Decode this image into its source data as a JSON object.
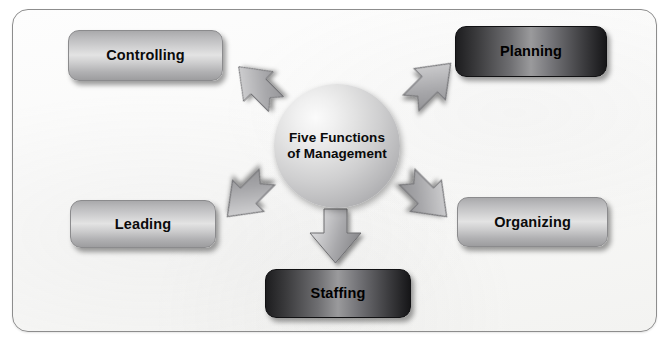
{
  "diagram": {
    "title": "Five Functions of Management",
    "center": {
      "label_line1": "Five Functions",
      "label_line2": "of Management",
      "shape": "sphere"
    },
    "boxes": [
      {
        "id": "controlling",
        "label": "Controlling",
        "style": "light",
        "position": "top-left"
      },
      {
        "id": "planning",
        "label": "Planning",
        "style": "dark",
        "position": "top-right"
      },
      {
        "id": "leading",
        "label": "Leading",
        "style": "light",
        "position": "middle-left"
      },
      {
        "id": "organizing",
        "label": "Organizing",
        "style": "light",
        "position": "middle-right"
      },
      {
        "id": "staffing",
        "label": "Staffing",
        "style": "dark",
        "position": "bottom-center"
      }
    ],
    "arrows": [
      {
        "id": "arrow-up-left",
        "direction": "up-left",
        "from": "center",
        "to": "controlling"
      },
      {
        "id": "arrow-up-right",
        "direction": "up-right",
        "from": "center",
        "to": "planning"
      },
      {
        "id": "arrow-down-left",
        "direction": "down-left",
        "from": "center",
        "to": "leading"
      },
      {
        "id": "arrow-down-right",
        "direction": "down-right",
        "from": "center",
        "to": "organizing"
      },
      {
        "id": "arrow-down",
        "direction": "down",
        "from": "center",
        "to": "staffing"
      }
    ],
    "colors": {
      "frame_border": "#8d8d8d",
      "frame_fill": "#f8f8f7",
      "box_light": "#d2d2d3",
      "box_dark": "#1d1d1f",
      "arrow_fill": "#b4b4b6",
      "sphere_fill": "#cfcfd0",
      "text": "#0b0b0b"
    }
  }
}
